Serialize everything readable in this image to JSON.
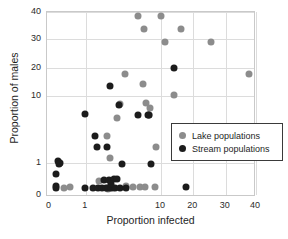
{
  "chart_data": {
    "type": "scatter",
    "title": "",
    "xlabel": "Proportion infected",
    "ylabel": "Proportion of males",
    "xscale": "symlog",
    "yscale": "symlog",
    "xlim": [
      0,
      40
    ],
    "ylim": [
      0,
      40
    ],
    "xticks": [
      0,
      1,
      10,
      20,
      30,
      40
    ],
    "xtick_labels": [
      "0",
      "1",
      "10",
      "20",
      "30",
      "40"
    ],
    "yticks": [
      0,
      1,
      10,
      20,
      30,
      40
    ],
    "ytick_labels": [
      "0",
      "1",
      "10",
      "20",
      "30",
      "40"
    ],
    "grid": true,
    "legend_position": "center-right",
    "series": [
      {
        "name": "Lake populations",
        "color": "#8c8c8c",
        "points": [
          [
            5.0,
            38.4
          ],
          [
            10.0,
            38.3
          ],
          [
            6.0,
            33.3
          ],
          [
            15.5,
            33.5
          ],
          [
            11.0,
            28.7
          ],
          [
            25.0,
            28.6
          ],
          [
            37.5,
            16.9
          ],
          [
            3.3,
            17.0
          ],
          [
            5.8,
            13.5
          ],
          [
            13.3,
            10.4
          ],
          [
            2.9,
            7.6
          ],
          [
            6.3,
            8.0
          ],
          [
            7.2,
            6.6
          ],
          [
            7.0,
            5.2
          ],
          [
            2.6,
            4.7
          ],
          [
            1.9,
            2.5
          ],
          [
            2.1,
            1.2
          ],
          [
            1.5,
            0.22
          ],
          [
            8.6,
            1.7
          ],
          [
            3.4,
            0.1
          ],
          [
            4.2,
            0.08
          ],
          [
            5.2,
            0.07
          ],
          [
            6.2,
            0.07
          ],
          [
            8.3,
            0.07
          ],
          [
            0.35,
            0.07
          ],
          [
            0.18,
            0.06
          ],
          [
            2.3,
            0.06
          ],
          [
            2.0,
            0.05
          ]
        ]
      },
      {
        "name": "Stream populations",
        "color": "#1c1c1c",
        "points": [
          [
            13.3,
            19.8
          ],
          [
            2.1,
            12.8
          ],
          [
            2.8,
            7.4
          ],
          [
            4.9,
            5.2
          ],
          [
            6.7,
            5.2
          ],
          [
            7.0,
            5.3
          ],
          [
            0.95,
            5.4
          ],
          [
            1.35,
            2.5
          ],
          [
            1.4,
            1.75
          ],
          [
            1.9,
            1.75
          ],
          [
            3.0,
            0.95
          ],
          [
            7.3,
            0.93
          ],
          [
            0.07,
            1.05
          ],
          [
            0.1,
            1.0
          ],
          [
            0.09,
            0.92
          ],
          [
            0.05,
            0.44
          ],
          [
            0.04,
            0.1
          ],
          [
            0.045,
            0.06
          ],
          [
            0.95,
            0.06
          ],
          [
            1.25,
            0.06
          ],
          [
            1.45,
            0.06
          ],
          [
            1.65,
            0.06
          ],
          [
            1.75,
            0.25
          ],
          [
            2.05,
            0.26
          ],
          [
            2.35,
            0.27
          ],
          [
            2.6,
            0.27
          ],
          [
            1.85,
            0.06
          ],
          [
            2.0,
            0.06
          ],
          [
            2.2,
            0.06
          ],
          [
            2.45,
            0.06
          ],
          [
            2.9,
            0.06
          ],
          [
            3.4,
            0.06
          ],
          [
            17.0,
            0.07
          ],
          [
            2.15,
            0.13
          ]
        ]
      }
    ]
  }
}
